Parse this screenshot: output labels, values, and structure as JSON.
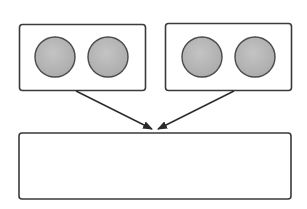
{
  "diagram": {
    "type": "two-to-one flow",
    "colors": {
      "stroke": "#3a3a3a",
      "circle_fill": "#b8b8b8",
      "background": "#ffffff"
    },
    "source_boxes": [
      {
        "id": "left-group",
        "items": 2
      },
      {
        "id": "right-group",
        "items": 2
      }
    ],
    "target_box": {
      "id": "combined-box",
      "content": ""
    },
    "arrows": [
      {
        "from": "left-group",
        "to": "combined-box"
      },
      {
        "from": "right-group",
        "to": "combined-box"
      }
    ]
  }
}
